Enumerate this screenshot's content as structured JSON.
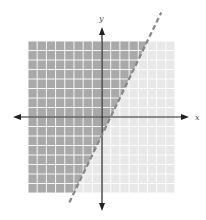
{
  "chart_data": {
    "type": "inequality-graph",
    "title": "",
    "xlabel": "x",
    "ylabel": "y",
    "xlim": [
      -8,
      8
    ],
    "ylim": [
      -8,
      8
    ],
    "grid": true,
    "grid_step": 1,
    "boundary": {
      "equation": "y = 2x - 2",
      "slope": 2,
      "intercept": -2,
      "style": "dashed",
      "points": [
        [
          -3.5,
          -9
        ],
        [
          6.5,
          11
        ]
      ]
    },
    "inequality": "y > 2x - 2",
    "shaded_region": "left/above boundary line",
    "colors": {
      "shaded": "#a9a9a9",
      "unshaded": "#e8e8e8",
      "grid_line": "#ffffff",
      "axis": "#222222",
      "boundary": "#888888"
    }
  },
  "labels": {
    "x": "x",
    "y": "y"
  }
}
